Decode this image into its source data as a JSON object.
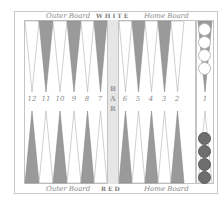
{
  "board": {
    "top_labels": {
      "outer": "Outer Board",
      "player": "WHITE",
      "home": "Home Board"
    },
    "bottom_labels": {
      "outer": "Outer Board",
      "player": "RED",
      "home": "Home Board"
    },
    "bar_label": [
      "B",
      "A",
      "R"
    ],
    "point_numbers_left": [
      "12",
      "11",
      "10",
      "9",
      "8",
      "7"
    ],
    "point_numbers_right": [
      "6",
      "5",
      "4",
      "3",
      "2",
      "1"
    ],
    "colors": {
      "dark_point": "#9a9a9a",
      "light_point": "#ffffff",
      "white_checker": "#ffffff",
      "red_checker": "#6e6e6e",
      "bar": "#e6e6e6"
    },
    "tray": {
      "white_checkers": 4,
      "red_checkers": 4
    }
  }
}
